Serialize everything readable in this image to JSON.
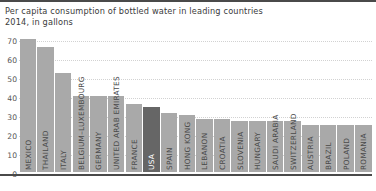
{
  "title": {
    "line1": "Per capita consumption of bottled water in leading countries",
    "line2": "2014, in gallons"
  },
  "colors": {
    "bar": "#a9a9a9",
    "bar_highlight": "#666666",
    "gridline": "#d2d2d2",
    "axis": "#4a4a4a",
    "text": "#3b3b3b"
  },
  "chart_data": {
    "type": "bar",
    "title": "Per capita consumption of bottled water in leading countries",
    "subtitle": "2014, in gallons",
    "xlabel": "",
    "ylabel": "",
    "ylim": [
      0,
      70
    ],
    "yticks": [
      0,
      10,
      20,
      30,
      40,
      50,
      60,
      70
    ],
    "grid": true,
    "legend": "none",
    "highlighted_category": "USA",
    "categories": [
      "MEXICO",
      "THAILAND",
      "ITALY",
      "BELGIUM–LUXEMBOURG",
      "GERMANY",
      "UNITED ARAB EMIRATES",
      "FRANCE",
      "USA",
      "SPAIN",
      "HONG KONG",
      "LEBANON",
      "CROATIA",
      "SLOVENIA",
      "HUNGARY",
      "SAUDI ARABIA",
      "SWITZERLAND",
      "AUSTRIA",
      "BRAZIL",
      "POLAND",
      "ROMANIA"
    ],
    "values": [
      70,
      66,
      52,
      40,
      40,
      40,
      36,
      34,
      31,
      30,
      28,
      28,
      27,
      27,
      27,
      27,
      25,
      25,
      25,
      25
    ]
  }
}
